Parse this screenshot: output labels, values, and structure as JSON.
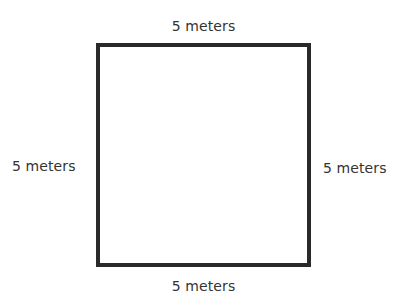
{
  "diagram": {
    "shape": "square",
    "stroke_color": "#2a2a2a",
    "labels": {
      "top": "5 meters",
      "bottom": "5 meters",
      "left": "5 meters",
      "right": "5 meters"
    }
  }
}
